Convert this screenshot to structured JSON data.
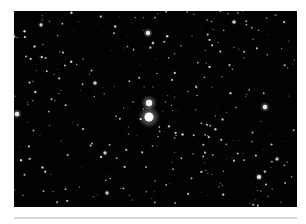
{
  "image": {
    "subject": "star field",
    "background_color": "#020202",
    "frame": {
      "x": 14,
      "y": 11,
      "width": 283,
      "height": 196
    }
  },
  "bright_stars": [
    {
      "x": 135,
      "y": 106,
      "r": 4.5,
      "glow": 11,
      "brightness": 1.0
    },
    {
      "x": 135,
      "y": 92,
      "r": 3.2,
      "glow": 8,
      "brightness": 0.9
    },
    {
      "x": 134,
      "y": 22,
      "r": 2.2,
      "glow": 5,
      "brightness": 0.85
    },
    {
      "x": 3,
      "y": 103,
      "r": 2.2,
      "glow": 5,
      "brightness": 0.85
    },
    {
      "x": 251,
      "y": 96,
      "r": 2.2,
      "glow": 5,
      "brightness": 0.85
    },
    {
      "x": 245,
      "y": 166,
      "r": 2.0,
      "glow": 4,
      "brightness": 0.85
    },
    {
      "x": 81,
      "y": 72,
      "r": 1.6,
      "glow": 3,
      "brightness": 0.7
    },
    {
      "x": 220,
      "y": 11,
      "r": 1.6,
      "glow": 3,
      "brightness": 0.7
    },
    {
      "x": 27,
      "y": 14,
      "r": 1.4,
      "glow": 3,
      "brightness": 0.7
    },
    {
      "x": 91,
      "y": 142,
      "r": 1.4,
      "glow": 3,
      "brightness": 0.7
    },
    {
      "x": 93,
      "y": 182,
      "r": 1.4,
      "glow": 3,
      "brightness": 0.7
    },
    {
      "x": 263,
      "y": 148,
      "r": 1.3,
      "glow": 3,
      "brightness": 0.65
    },
    {
      "x": 139,
      "y": 32,
      "r": 1.2,
      "glow": 2,
      "brightness": 0.6
    }
  ],
  "faint_star_count": 420,
  "faint_star_seed": 7,
  "rule": {
    "color": "#d8d8d8",
    "y": 217
  }
}
